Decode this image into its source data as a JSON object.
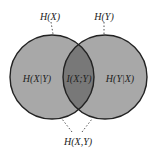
{
  "diagram": {
    "type": "venn",
    "labels": {
      "hx": "H(X)",
      "hy": "H(Y)",
      "hx_given_y": "H(X|Y)",
      "mutual": "I(X;Y)",
      "hy_given_x": "H(Y|X)",
      "joint": "H(X,Y)"
    },
    "colors": {
      "circle_fill": "#a6a6a6",
      "overlap_fill": "#7a7a7a",
      "stroke": "#222222"
    }
  }
}
